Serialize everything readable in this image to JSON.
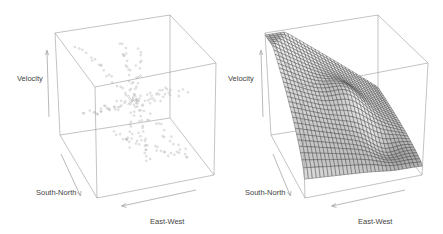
{
  "chart_data": [
    {
      "type": "scatter",
      "title": "",
      "panel": "left",
      "xlabel": "East-West",
      "ylabel": "South-North",
      "zlabel": "Velocity",
      "xlim": [
        0,
        1
      ],
      "ylim": [
        0,
        1
      ],
      "zlim": [
        0,
        1
      ],
      "grid": false,
      "legend": "none",
      "point_color": "#b0b0b0",
      "points_description": "3D scatter of velocity observations arranged along several radial transects crossing near the center of the cube",
      "transects": [
        {
          "name": "transect-1",
          "from": [
            0.15,
            0.85,
            0.92
          ],
          "to": [
            0.85,
            0.15,
            0.1
          ],
          "n": 45
        },
        {
          "name": "transect-2",
          "from": [
            0.1,
            0.3,
            0.6
          ],
          "to": [
            0.9,
            0.7,
            0.45
          ],
          "n": 35
        },
        {
          "name": "transect-3",
          "from": [
            0.55,
            0.95,
            0.85
          ],
          "to": [
            0.45,
            0.05,
            0.2
          ],
          "n": 40
        },
        {
          "name": "transect-4",
          "from": [
            0.05,
            0.55,
            0.45
          ],
          "to": [
            0.95,
            0.45,
            0.55
          ],
          "n": 30
        },
        {
          "name": "transect-5",
          "from": [
            0.7,
            0.9,
            0.75
          ],
          "to": [
            0.3,
            0.1,
            0.35
          ],
          "n": 30
        },
        {
          "name": "transect-6",
          "from": [
            0.35,
            0.6,
            0.18
          ],
          "to": [
            0.8,
            0.25,
            0.08
          ],
          "n": 25
        }
      ]
    },
    {
      "type": "surface",
      "title": "",
      "panel": "right",
      "xlabel": "East-West",
      "ylabel": "South-North",
      "zlabel": "Velocity",
      "xlim": [
        0,
        1
      ],
      "ylim": [
        0,
        1
      ],
      "zlim": [
        0,
        1
      ],
      "grid": false,
      "legend": "none",
      "mesh_color": "#2a2a2a",
      "shading": "grayscale",
      "grid_resolution": [
        30,
        30
      ],
      "surface_description": "Fitted velocity surface: high at the back-left corner, descending toward the front-right with a shallow bump near the middle and a trough near the front-right"
    }
  ],
  "axis_labels": {
    "velocity": "Velocity",
    "south_north": "South-North",
    "east_west": "East-West"
  }
}
